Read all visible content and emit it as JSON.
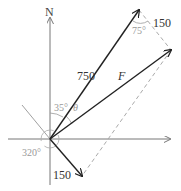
{
  "diagram": {
    "axes": {
      "north_label": "N"
    },
    "vectors": [
      {
        "id": "v750",
        "magnitude_label": "750",
        "bearing_label": "35°"
      },
      {
        "id": "v150",
        "magnitude_label": "150",
        "bearing_label": "320°"
      },
      {
        "id": "resultant",
        "label": "F",
        "angle_label": "θ"
      }
    ],
    "parallelogram": {
      "side_label": "150",
      "angle_label": "75°"
    },
    "colors": {
      "vector": "#222222",
      "axis": "#777777",
      "dashed": "#aaaaaa",
      "angle_text": "#999999",
      "text": "#333333"
    }
  }
}
